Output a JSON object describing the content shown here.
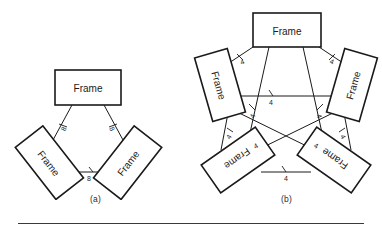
{
  "figure": {
    "background_color": "#ffffff",
    "line_color": "#1a1a1a",
    "label_color": "#222222",
    "rule_color": "#3a3a3a"
  },
  "panels": [
    {
      "id": "a",
      "caption": "(a)",
      "node_count": 3,
      "node_label": "Frame",
      "nodes": [
        {
          "name": "frame-top",
          "label": "Frame",
          "rotation": 0
        },
        {
          "name": "frame-lower-left",
          "label": "Frame",
          "rotation": 52
        },
        {
          "name": "frame-lower-right",
          "label": "Frame",
          "rotation": -52
        }
      ],
      "edges": [
        {
          "name": "edge-top-to-lower-left",
          "label": "8"
        },
        {
          "name": "edge-top-to-lower-right",
          "label": "8"
        },
        {
          "name": "edge-lower-left-to-lower-right",
          "label": "8"
        }
      ],
      "edge_label_value": "8"
    },
    {
      "id": "b",
      "caption": "(b)",
      "node_count": 5,
      "node_label": "Frame",
      "nodes": [
        {
          "name": "frame-top",
          "label": "Frame",
          "rotation": 0
        },
        {
          "name": "frame-upper-left",
          "label": "Frame",
          "rotation": 74
        },
        {
          "name": "frame-upper-right",
          "label": "Frame",
          "rotation": -74
        },
        {
          "name": "frame-lower-left",
          "label": "Frame",
          "rotation": 145
        },
        {
          "name": "frame-lower-right",
          "label": "Frame",
          "rotation": -145
        }
      ],
      "edges": [
        {
          "name": "edge-top-to-upper-left",
          "label": "4"
        },
        {
          "name": "edge-top-to-upper-right",
          "label": "4"
        },
        {
          "name": "edge-top-to-lower-left",
          "label": "4"
        },
        {
          "name": "edge-top-to-lower-right",
          "label": "4"
        },
        {
          "name": "edge-upper-left-to-upper-right",
          "label": "4"
        },
        {
          "name": "edge-upper-left-to-lower-left",
          "label": "4"
        },
        {
          "name": "edge-upper-left-to-lower-right",
          "label": "4"
        },
        {
          "name": "edge-upper-right-to-lower-right",
          "label": "4"
        },
        {
          "name": "edge-upper-right-to-lower-left",
          "label": "4"
        },
        {
          "name": "edge-lower-left-to-lower-right",
          "label": "4"
        }
      ],
      "edge_label_value": "4"
    }
  ]
}
